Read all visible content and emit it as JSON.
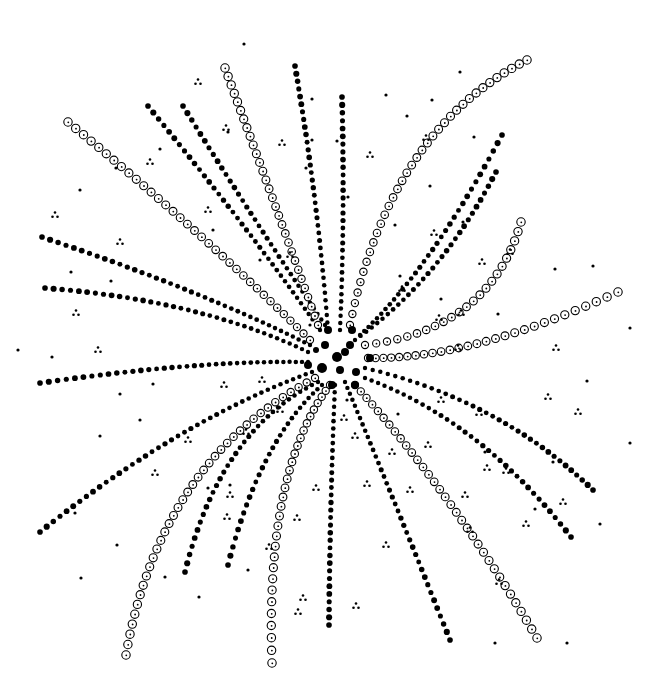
{
  "colors": {
    "ink": "#000000",
    "background": "#ffffff"
  },
  "center": [
    337,
    357
  ],
  "strands": [
    {
      "style": "solid",
      "from": [
        295,
        66
      ],
      "ctrl": [
        318,
        200
      ],
      "to": [
        328,
        330
      ]
    },
    {
      "style": "solid",
      "from": [
        342,
        97
      ],
      "ctrl": [
        345,
        220
      ],
      "to": [
        340,
        330
      ]
    },
    {
      "style": "solid",
      "from": [
        148,
        106
      ],
      "ctrl": [
        250,
        230
      ],
      "to": [
        320,
        330
      ]
    },
    {
      "style": "solid",
      "from": [
        183,
        106
      ],
      "ctrl": [
        260,
        230
      ],
      "to": [
        325,
        325
      ]
    },
    {
      "style": "open",
      "from": [
        225,
        68
      ],
      "ctrl": [
        270,
        190
      ],
      "to": [
        318,
        325
      ]
    },
    {
      "style": "open",
      "from": [
        68,
        122
      ],
      "ctrl": [
        200,
        230
      ],
      "to": [
        310,
        340
      ]
    },
    {
      "style": "solid",
      "from": [
        42,
        237
      ],
      "ctrl": [
        200,
        290
      ],
      "to": [
        310,
        345
      ]
    },
    {
      "style": "solid",
      "from": [
        45,
        288
      ],
      "ctrl": [
        200,
        300
      ],
      "to": [
        308,
        352
      ]
    },
    {
      "style": "solid",
      "from": [
        40,
        383
      ],
      "ctrl": [
        200,
        360
      ],
      "to": [
        308,
        362
      ]
    },
    {
      "style": "solid",
      "from": [
        40,
        532
      ],
      "ctrl": [
        180,
        420
      ],
      "to": [
        312,
        372
      ]
    },
    {
      "style": "open",
      "from": [
        126,
        655
      ],
      "ctrl": [
        160,
        460
      ],
      "to": [
        315,
        378
      ]
    },
    {
      "style": "solid",
      "from": [
        185,
        572
      ],
      "ctrl": [
        220,
        430
      ],
      "to": [
        318,
        382
      ]
    },
    {
      "style": "solid",
      "from": [
        228,
        565
      ],
      "ctrl": [
        260,
        440
      ],
      "to": [
        322,
        385
      ]
    },
    {
      "style": "open",
      "from": [
        272,
        663
      ],
      "ctrl": [
        265,
        470
      ],
      "to": [
        330,
        385
      ]
    },
    {
      "style": "solid",
      "from": [
        329,
        625
      ],
      "ctrl": [
        330,
        500
      ],
      "to": [
        335,
        385
      ]
    },
    {
      "style": "solid",
      "from": [
        450,
        640
      ],
      "ctrl": [
        390,
        490
      ],
      "to": [
        345,
        382
      ]
    },
    {
      "style": "open",
      "from": [
        537,
        638
      ],
      "ctrl": [
        450,
        490
      ],
      "to": [
        355,
        385
      ]
    },
    {
      "style": "solid",
      "from": [
        571,
        537
      ],
      "ctrl": [
        480,
        420
      ],
      "to": [
        365,
        378
      ]
    },
    {
      "style": "solid",
      "from": [
        593,
        490
      ],
      "ctrl": [
        500,
        400
      ],
      "to": [
        365,
        368
      ]
    },
    {
      "style": "open",
      "from": [
        618,
        292
      ],
      "ctrl": [
        470,
        360
      ],
      "to": [
        368,
        358
      ]
    },
    {
      "style": "open",
      "from": [
        521,
        222
      ],
      "ctrl": [
        490,
        330
      ],
      "to": [
        365,
        345
      ]
    },
    {
      "style": "solid",
      "from": [
        502,
        135
      ],
      "ctrl": [
        430,
        270
      ],
      "to": [
        360,
        335
      ]
    },
    {
      "style": "solid",
      "from": [
        496,
        172
      ],
      "ctrl": [
        440,
        280
      ],
      "to": [
        355,
        340
      ]
    },
    {
      "style": "open",
      "from": [
        527,
        60
      ],
      "ctrl": [
        390,
        130
      ],
      "to": [
        350,
        325
      ]
    }
  ],
  "center_dots": [
    [
      337,
      357,
      5
    ],
    [
      325,
      345,
      4
    ],
    [
      350,
      345,
      4
    ],
    [
      322,
      368,
      5
    ],
    [
      352,
      330,
      4
    ],
    [
      370,
      358,
      4
    ],
    [
      308,
      365,
      4
    ],
    [
      340,
      370,
      4
    ],
    [
      328,
      330,
      4
    ],
    [
      356,
      372,
      4
    ],
    [
      316,
      350,
      3
    ],
    [
      345,
      352,
      4
    ],
    [
      332,
      385,
      4
    ],
    [
      355,
      385,
      4
    ]
  ],
  "scatter_dots": [
    [
      244,
      44
    ],
    [
      160,
      149
    ],
    [
      228,
      132
    ],
    [
      116,
      168
    ],
    [
      312,
      99
    ],
    [
      386,
      95
    ],
    [
      337,
      141
    ],
    [
      460,
      72
    ],
    [
      432,
      100
    ],
    [
      407,
      116
    ],
    [
      474,
      137
    ],
    [
      430,
      186
    ],
    [
      312,
      140
    ],
    [
      306,
      168
    ],
    [
      395,
      225
    ],
    [
      348,
      197
    ],
    [
      463,
      222
    ],
    [
      400,
      276
    ],
    [
      555,
      269
    ],
    [
      593,
      266
    ],
    [
      498,
      314
    ],
    [
      441,
      299
    ],
    [
      587,
      381
    ],
    [
      630,
      328
    ],
    [
      71,
      272
    ],
    [
      111,
      281
    ],
    [
      120,
      394
    ],
    [
      153,
      384
    ],
    [
      100,
      436
    ],
    [
      75,
      513
    ],
    [
      117,
      545
    ],
    [
      81,
      578
    ],
    [
      165,
      577
    ],
    [
      199,
      597
    ],
    [
      208,
      488
    ],
    [
      248,
      570
    ],
    [
      230,
      485
    ],
    [
      398,
      414
    ],
    [
      485,
      452
    ],
    [
      553,
      462
    ],
    [
      535,
      509
    ],
    [
      600,
      524
    ],
    [
      567,
      643
    ],
    [
      495,
      643
    ],
    [
      347,
      400
    ],
    [
      310,
      325
    ],
    [
      260,
      260
    ],
    [
      213,
      230
    ],
    [
      140,
      420
    ],
    [
      80,
      190
    ],
    [
      52,
      357
    ],
    [
      18,
      350
    ],
    [
      630,
      443
    ]
  ],
  "clusters": [
    [
      198,
      82
    ],
    [
      226,
      128
    ],
    [
      150,
      162
    ],
    [
      282,
      143
    ],
    [
      208,
      210
    ],
    [
      120,
      242
    ],
    [
      76,
      313
    ],
    [
      98,
      350
    ],
    [
      55,
      215
    ],
    [
      290,
      255
    ],
    [
      370,
      155
    ],
    [
      426,
      138
    ],
    [
      434,
      233
    ],
    [
      402,
      289
    ],
    [
      482,
      262
    ],
    [
      510,
      252
    ],
    [
      461,
      313
    ],
    [
      439,
      318
    ],
    [
      458,
      348
    ],
    [
      556,
      348
    ],
    [
      479,
      413
    ],
    [
      548,
      397
    ],
    [
      441,
      400
    ],
    [
      392,
      452
    ],
    [
      355,
      436
    ],
    [
      428,
      445
    ],
    [
      367,
      484
    ],
    [
      316,
      488
    ],
    [
      297,
      518
    ],
    [
      410,
      490
    ],
    [
      487,
      468
    ],
    [
      506,
      471
    ],
    [
      344,
      418
    ],
    [
      227,
      517
    ],
    [
      188,
      440
    ],
    [
      246,
      432
    ],
    [
      230,
      495
    ],
    [
      155,
      473
    ],
    [
      269,
      547
    ],
    [
      303,
      598
    ],
    [
      298,
      612
    ],
    [
      356,
      606
    ],
    [
      386,
      545
    ],
    [
      465,
      495
    ],
    [
      499,
      582
    ],
    [
      526,
      524
    ],
    [
      470,
      530
    ],
    [
      563,
      502
    ],
    [
      578,
      412
    ],
    [
      280,
      410
    ],
    [
      224,
      385
    ],
    [
      262,
      380
    ]
  ]
}
